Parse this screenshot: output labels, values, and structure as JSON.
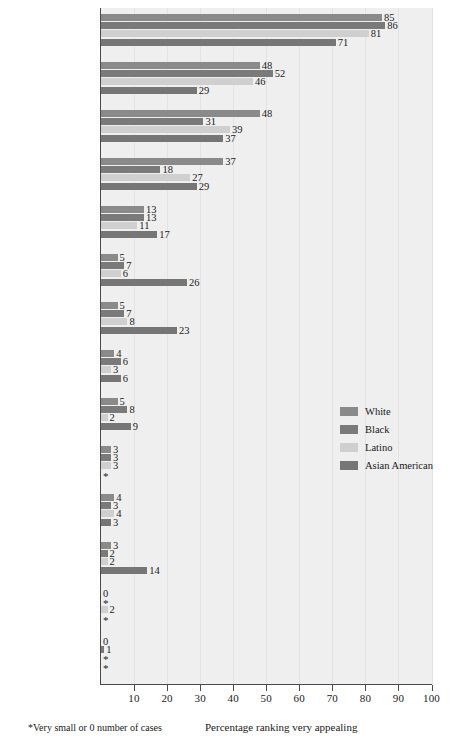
{
  "chart_data": {
    "type": "bar",
    "orientation": "horizontal",
    "title": "",
    "xlabel": "Percentage ranking very appealing",
    "ylabel": "",
    "xlim": [
      0,
      100
    ],
    "xticks": [
      10,
      20,
      30,
      40,
      50,
      60,
      70,
      80,
      90,
      100
    ],
    "grid": true,
    "legend_position": "right-middle",
    "footnote": "*Very small or 0 number of cases",
    "star_note": "*",
    "series": [
      {
        "name": "White",
        "color": "#8a8a8a",
        "values": [
          85,
          48,
          48,
          37,
          13,
          5,
          5,
          4,
          5,
          3,
          4,
          3,
          0,
          0
        ]
      },
      {
        "name": "Black",
        "color": "#7a7a7a",
        "values": [
          86,
          52,
          31,
          18,
          13,
          7,
          7,
          6,
          8,
          3,
          3,
          2,
          "*",
          1
        ]
      },
      {
        "name": "Latino",
        "color": "#cfcfcf",
        "values": [
          81,
          46,
          39,
          27,
          11,
          6,
          8,
          3,
          2,
          3,
          4,
          2,
          2,
          "*"
        ]
      },
      {
        "name": "Asian American",
        "color": "#767676",
        "values": [
          71,
          29,
          37,
          29,
          17,
          26,
          23,
          6,
          9,
          "*",
          3,
          14,
          "*",
          "*"
        ]
      }
    ],
    "categories": [
      "Having vaginal intercourse",
      "Watching partner undress",
      "Receiving oral sex",
      "Giving oral sex",
      "Engaging in group sex",
      "Having anus stimulated by partner's finger",
      "Stimulating partner's anus",
      "Using dildo or vibrator",
      "Watching other people do sexual things",
      "Having same-gender partner",
      "Having sex with stranger",
      "Engaging in passive anal intercourse",
      "Forcing a sex partner",
      "Being forced by a sex partner"
    ],
    "category_lines": [
      [
        "Having vaginal",
        "intercourse"
      ],
      [
        "Watching",
        "partner",
        "undress"
      ],
      [
        "Receiving",
        "oral sex"
      ],
      [
        "Giving",
        "oral sex"
      ],
      [
        "Engaging in",
        "group sex"
      ],
      [
        "Having anus",
        "stimulated by",
        "partner's finger"
      ],
      [
        "Stimulating",
        "partner's",
        "anus"
      ],
      [
        "Using dildo",
        "or vibrator"
      ],
      [
        "Watching other",
        "people do",
        "sexual things"
      ],
      [
        "Having",
        "same-gender",
        "partner"
      ],
      [
        "Having sex",
        "with stranger"
      ],
      [
        "Engaging in",
        "passive anal",
        "intercourse"
      ],
      [
        "Forcing a",
        "sex partner"
      ],
      [
        "Being forced by",
        "a sex partner"
      ]
    ]
  },
  "legend": {
    "items": [
      {
        "label": "White",
        "color": "#8a8a8a"
      },
      {
        "label": "Black",
        "color": "#7a7a7a"
      },
      {
        "label": "Latino",
        "color": "#cfcfcf"
      },
      {
        "label": "Asian American",
        "color": "#767676"
      }
    ]
  },
  "axis": {
    "x_title": "Percentage ranking very appealing",
    "tick_labels": [
      "10",
      "20",
      "30",
      "40",
      "50",
      "60",
      "70",
      "80",
      "90",
      "100"
    ]
  },
  "notes": {
    "footnote": "*Very small or 0 number of cases"
  }
}
